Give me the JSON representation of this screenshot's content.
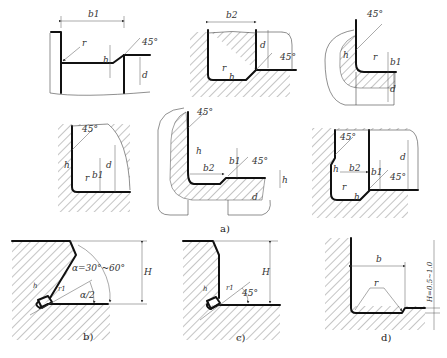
{
  "figure": {
    "panels": [
      {
        "id": "a1",
        "labels": {
          "width": "b1",
          "radius": "r",
          "depth_small": "h",
          "depth": "d",
          "angle": "45°"
        }
      },
      {
        "id": "a2",
        "labels": {
          "width": "b2",
          "radius": "r",
          "depth_small": "h",
          "depth": "d",
          "angle": "45°"
        }
      },
      {
        "id": "a3",
        "labels": {
          "angle": "45°",
          "depth_small": "h",
          "radius": "r",
          "width": "b1",
          "depth": "d"
        }
      },
      {
        "id": "a4",
        "labels": {
          "angle": "45°",
          "depth_small": "h",
          "radius": "r",
          "width": "b1",
          "depth": "d"
        }
      },
      {
        "id": "a5",
        "labels": {
          "angle_top": "45°",
          "depth_small": "h",
          "width1": "b1",
          "width2": "b2",
          "angle_right": "45°",
          "h_right": "h",
          "depth": "d"
        }
      },
      {
        "id": "a6",
        "labels": {
          "angle_top": "45°",
          "depth_small": "h",
          "width2": "b2",
          "width1": "b1",
          "radius": "r",
          "h_bottom": "h",
          "angle_right": "45°",
          "depth": "d"
        }
      },
      {
        "id": "b",
        "labels": {
          "alpha": "α=30°~60°",
          "half_alpha": "α/2",
          "height": "H",
          "tool_h": "h",
          "tool_r": "r1"
        }
      },
      {
        "id": "c",
        "labels": {
          "angle": "45°",
          "height": "H",
          "tool_h": "h",
          "tool_r": "r1"
        }
      },
      {
        "id": "d",
        "labels": {
          "width": "b",
          "radius": "r",
          "height": "H=0.5~1.0"
        }
      }
    ],
    "captions": {
      "a": "a)",
      "b": "b)",
      "c": "c)",
      "d": "d)"
    }
  }
}
